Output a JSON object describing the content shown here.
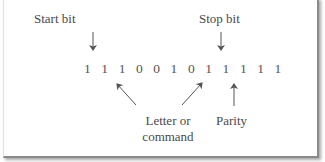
{
  "diagram": {
    "bit_sequence": "111001011111",
    "bits_display": "1 1 1 0 0 1 0 1 1 1 1 1",
    "labels": {
      "start_bit": "Start bit",
      "stop_bit": "Stop bit",
      "letter_line1": "Letter or",
      "letter_line2": "command",
      "parity": "Parity"
    },
    "colors": {
      "text": "#4a4a4a",
      "arrow": "#555555",
      "border": "#8a8a8a"
    }
  }
}
